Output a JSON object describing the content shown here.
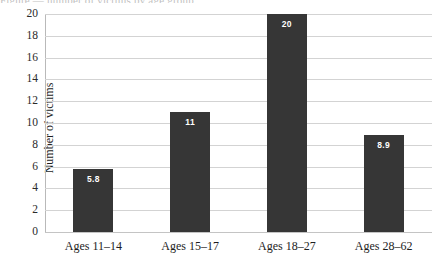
{
  "clipped_title": "Figure  —  number of victims by age group",
  "chart_data": {
    "type": "bar",
    "title": "",
    "xlabel": "",
    "ylabel": "Number of victims",
    "categories": [
      "Ages 11–14",
      "Ages 15–17",
      "Ages 18–27",
      "Ages 28–62"
    ],
    "values": [
      5.8,
      11,
      20,
      8.9
    ],
    "value_labels": [
      "5.8",
      "11",
      "20",
      "8.9"
    ],
    "ylim": [
      0,
      20
    ],
    "ytick_labels": [
      "20",
      "18",
      "16",
      "14",
      "12",
      "10",
      "8",
      "6",
      "4",
      "2",
      "0"
    ],
    "ytick_values": [
      20,
      18,
      16,
      14,
      12,
      10,
      8,
      6,
      4,
      2,
      0
    ],
    "grid": true,
    "legend": false,
    "bar_color": "#363636",
    "value_label_color": "#ffffff",
    "gridline_color": "#d3d3d3",
    "axis_color": "#b9b9b9",
    "background": "#ffffff"
  }
}
